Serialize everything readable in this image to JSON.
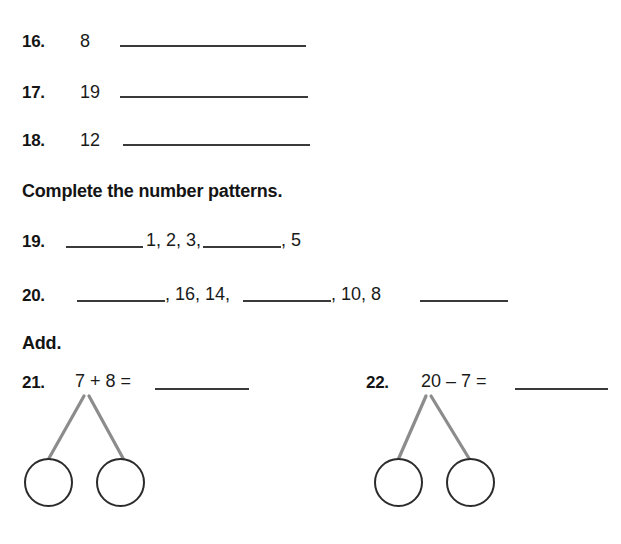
{
  "worksheet": {
    "rows_1_3": [
      {
        "number": "16.",
        "value": "8"
      },
      {
        "number": "17.",
        "value": "19"
      },
      {
        "number": "18.",
        "value": "12"
      }
    ],
    "patterns_heading": "Complete the number patterns.",
    "patterns": [
      {
        "number": "19.",
        "segment_1": "1, 2, 3,",
        "segment_2": ", 5"
      },
      {
        "number": "20.",
        "segment_1": ", 16, 14,",
        "segment_2": ", 10, 8"
      }
    ],
    "add_heading": "Add.",
    "problems": [
      {
        "number": "21.",
        "equation": "7 + 8 =",
        "bond_circles": [
          "",
          ""
        ]
      },
      {
        "number": "22.",
        "equation": "20 – 7 =",
        "bond_circles": [
          "",
          ""
        ]
      }
    ]
  },
  "colors": {
    "ink": "#1a1a1a",
    "rule": "#3a3a3a",
    "bond_line": "#8c8c8c",
    "circle_stroke": "#2b2b2b",
    "page_background": "#ffffff"
  }
}
